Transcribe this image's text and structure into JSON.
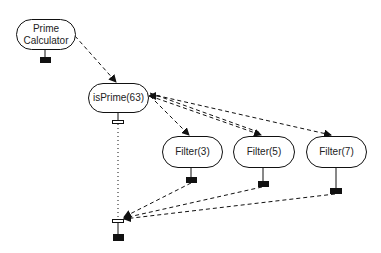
{
  "diagram": {
    "type": "sequence/activation diagram",
    "nodes": [
      {
        "id": "prime-calculator",
        "lines": [
          "Prime",
          "Calculator"
        ]
      },
      {
        "id": "isprime",
        "label": "isPrime(63)"
      },
      {
        "id": "filter3",
        "label": "Filter(3)"
      },
      {
        "id": "filter5",
        "label": "Filter(5)"
      },
      {
        "id": "filter7",
        "label": "Filter(7)"
      }
    ],
    "edges": [
      {
        "from": "prime-calculator",
        "to": "isprime",
        "style": "dashed-arrow"
      },
      {
        "from": "isprime",
        "to": "isprime",
        "style": "dashed-arrow",
        "note": "incoming arrowhead on right side"
      },
      {
        "from": "isprime",
        "to": "filter3",
        "style": "dashed-arrow"
      },
      {
        "from": "isprime",
        "to": "filter5",
        "style": "dashed-arrow"
      },
      {
        "from": "isprime",
        "to": "filter7",
        "style": "dashed-arrow"
      },
      {
        "from": "filter3",
        "to": "join-bar",
        "style": "dashed-arrow"
      },
      {
        "from": "filter5",
        "to": "join-bar",
        "style": "dashed-arrow"
      },
      {
        "from": "filter7",
        "to": "join-bar",
        "style": "dashed-arrow"
      },
      {
        "from": "isprime",
        "to": "join-bar",
        "style": "dotted-line"
      }
    ],
    "colors": {
      "stroke": "#111111",
      "fill": "#ffffff",
      "terminal": "#111111"
    }
  }
}
